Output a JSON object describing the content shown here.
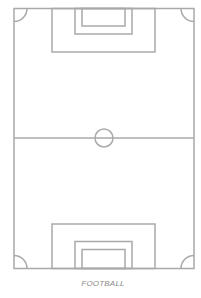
{
  "diagram": {
    "title": "FOOTBALL",
    "type": "football-pitch-top-view",
    "line_color": "#a9a9a9",
    "background": "#ffffff"
  }
}
